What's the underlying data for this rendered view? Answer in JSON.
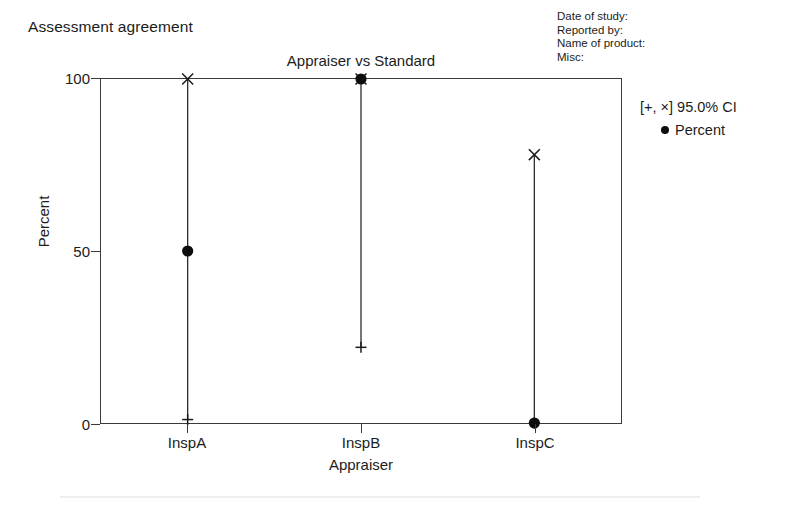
{
  "report": {
    "title": "Assessment agreement"
  },
  "metadata": {
    "lines": [
      "Date of study:",
      "Reported by:",
      "Name of product:",
      "Misc:"
    ]
  },
  "legend": {
    "ci_label": "[+, ×] 95.0% CI",
    "percent_label": "Percent",
    "dot_icon": "filled-circle-icon"
  },
  "chart_data": {
    "type": "scatter",
    "title": "Appraiser vs Standard",
    "xlabel": "Appraiser",
    "ylabel": "Percent",
    "categories": [
      "InspA",
      "InspB",
      "InspC"
    ],
    "values": [
      50,
      100,
      0
    ],
    "series": [
      {
        "name": "Percent",
        "marker": "filled-circle",
        "values": [
          50,
          100,
          0
        ]
      },
      {
        "name": "95.0% CI upper",
        "marker": "cross-x",
        "values": [
          100,
          100,
          78
        ]
      },
      {
        "name": "95.0% CI lower",
        "marker": "plus",
        "values": [
          1,
          22,
          0
        ]
      }
    ],
    "ylim": [
      0,
      100
    ],
    "yticks": [
      0,
      50,
      100
    ],
    "ytick_labels": [
      "0",
      "50",
      "100"
    ],
    "grid": false,
    "legend_position": "right",
    "ci_level": "95.0%"
  }
}
